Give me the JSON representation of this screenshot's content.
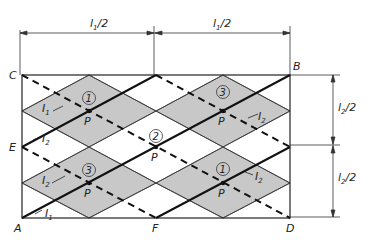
{
  "figure": {
    "type": "panel-zone diamond lattice diagram",
    "colors": {
      "shade": "#c8c8c8",
      "line": "#222222",
      "background": "#ffffff"
    }
  },
  "corners": {
    "A": "A",
    "B": "B",
    "C": "C",
    "D": "D",
    "E": "E",
    "F": "F"
  },
  "dimensions": {
    "top_left": {
      "main": "l",
      "sub": "1",
      "rest": "/2"
    },
    "top_right": {
      "main": "l",
      "sub": "1",
      "rest": "/2"
    },
    "right_upper": {
      "main": "l",
      "sub": "2",
      "rest": "/2"
    },
    "right_lower": {
      "main": "l",
      "sub": "2",
      "rest": "/2"
    }
  },
  "regions": [
    {
      "id": "1",
      "label": "1",
      "position": "upper-left"
    },
    {
      "id": "3",
      "label": "3",
      "position": "upper-right"
    },
    {
      "id": "2",
      "label": "2",
      "position": "center"
    },
    {
      "id": "3b",
      "label": "3",
      "position": "lower-left"
    },
    {
      "id": "1b",
      "label": "1",
      "position": "lower-right"
    }
  ],
  "points": {
    "P": "P"
  },
  "currents": {
    "I1_upper": {
      "main": "I",
      "sub": "1"
    },
    "I2_left": {
      "main": "I",
      "sub": "2"
    },
    "I2_lower_left": {
      "main": "I",
      "sub": "2"
    },
    "I1_lower": {
      "main": "I",
      "sub": "1"
    },
    "I2_upper_right": {
      "main": "I",
      "sub": "2"
    },
    "I2_lower_right": {
      "main": "I",
      "sub": "2"
    }
  }
}
